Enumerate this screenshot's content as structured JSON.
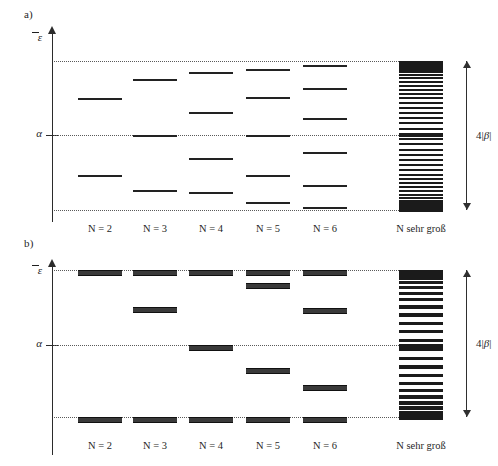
{
  "figure": {
    "caption_a": "a)",
    "caption_b": "b)",
    "axis_label_energy": "ε",
    "axis_label_alpha": "α",
    "measure_label_prefix": "4|",
    "measure_label_symbol": "β",
    "measure_label_suffix": "|",
    "column_labels": [
      "N = 2",
      "N = 3",
      "N = 4",
      "N = 5",
      "N = 6",
      "N sehr groß"
    ]
  },
  "chart_data": {
    "type": "scatter",
    "xlabel": "",
    "ylabel": "ε",
    "grid": false,
    "legend": null,
    "axis_annotations": [
      {
        "label": "ε",
        "kind": "axis-arrow-top"
      },
      {
        "label": "α",
        "kind": "tick",
        "value": 0.0
      },
      {
        "label": "4|β|",
        "kind": "span",
        "from": -2.0,
        "to": 2.0
      }
    ],
    "reference_lines": [
      {
        "name": "upper-limit",
        "value": 2.0,
        "style": "dotted"
      },
      {
        "name": "alpha",
        "value": 0.0,
        "style": "dotted"
      },
      {
        "name": "lower-limit",
        "value": -2.0,
        "style": "dotted"
      }
    ],
    "ylim": [
      -2.35,
      2.35
    ],
    "note": "Energien in Einheiten von |β| relativ zu α; Bandbreite 4|β|",
    "panels": [
      {
        "id": "a",
        "label": "a)",
        "description": "lineare Polyene, nicht entartete Niveaus",
        "categories": [
          "N = 2",
          "N = 3",
          "N = 4",
          "N = 5",
          "N = 6",
          "N sehr groß"
        ],
        "series": [
          {
            "name": "N = 2",
            "values": [
              1.0,
              -1.0
            ],
            "degeneracies": [
              1,
              1
            ]
          },
          {
            "name": "N = 3",
            "values": [
              1.414,
              0.0,
              -1.414
            ],
            "degeneracies": [
              1,
              1,
              1
            ]
          },
          {
            "name": "N = 4",
            "values": [
              1.618,
              0.618,
              -0.618,
              -1.618
            ],
            "degeneracies": [
              1,
              1,
              1,
              1
            ]
          },
          {
            "name": "N = 5",
            "values": [
              1.732,
              1.0,
              0.0,
              -1.0,
              -1.732
            ],
            "degeneracies": [
              1,
              1,
              1,
              1,
              1
            ]
          },
          {
            "name": "N = 6",
            "values": [
              1.802,
              1.247,
              0.445,
              -0.445,
              -1.247,
              -1.802
            ],
            "degeneracies": [
              1,
              1,
              1,
              1,
              1,
              1
            ]
          },
          {
            "name": "N sehr groß",
            "values": [
              2.0,
              -2.0
            ],
            "degeneracies": [
              1,
              1
            ],
            "continuum": true,
            "band_levels": 44
          }
        ]
      },
      {
        "id": "b",
        "label": "b)",
        "description": "cyclische Annulene, paarweise entartete Niveaus",
        "categories": [
          "N = 2",
          "N = 3",
          "N = 4",
          "N = 5",
          "N = 6",
          "N sehr groß"
        ],
        "series": [
          {
            "name": "N = 2",
            "values": [
              2.0,
              -2.0
            ],
            "degeneracies": [
              1,
              1
            ]
          },
          {
            "name": "N = 3",
            "values": [
              2.0,
              1.0,
              -2.0
            ],
            "degeneracies": [
              1,
              2,
              1
            ]
          },
          {
            "name": "N = 4",
            "values": [
              2.0,
              0.0,
              -2.0
            ],
            "degeneracies": [
              1,
              2,
              1
            ]
          },
          {
            "name": "N = 5",
            "values": [
              2.0,
              1.618,
              -0.618,
              -2.0
            ],
            "degeneracies": [
              1,
              2,
              2,
              1
            ]
          },
          {
            "name": "N = 6",
            "values": [
              2.0,
              1.0,
              -1.0,
              -2.0
            ],
            "degeneracies": [
              1,
              2,
              2,
              1
            ]
          },
          {
            "name": "N sehr groß",
            "values": [
              2.0,
              -2.0
            ],
            "degeneracies": [
              1,
              1
            ],
            "continuum": true,
            "band_levels": 26
          }
        ]
      }
    ]
  },
  "geometry": {
    "panel_a": {
      "axis_top": 34,
      "axis_bottom": 222,
      "y_upper": 61,
      "y_alpha": 135,
      "y_lower": 210,
      "columns": [
        {
          "label": "N = 2",
          "x": 78,
          "w": 44,
          "cx": 100,
          "levels": [
            {
              "y": 98,
              "t": "thin"
            },
            {
              "y": 175,
              "t": "thin"
            }
          ]
        },
        {
          "label": "N = 3",
          "x": 133,
          "w": 44,
          "cx": 155,
          "levels": [
            {
              "y": 79,
              "t": "thin"
            },
            {
              "y": 135,
              "t": "thin"
            },
            {
              "y": 190,
              "t": "thin"
            }
          ]
        },
        {
          "label": "N = 4",
          "x": 189,
          "w": 44,
          "cx": 211,
          "levels": [
            {
              "y": 72,
              "t": "thin"
            },
            {
              "y": 112,
              "t": "thin"
            },
            {
              "y": 158,
              "t": "thin"
            },
            {
              "y": 192,
              "t": "thin"
            }
          ]
        },
        {
          "label": "N = 5",
          "x": 246,
          "w": 44,
          "cx": 268,
          "levels": [
            {
              "y": 69,
              "t": "thin"
            },
            {
              "y": 97,
              "t": "thin"
            },
            {
              "y": 135,
              "t": "thin"
            },
            {
              "y": 175,
              "t": "thin"
            },
            {
              "y": 202,
              "t": "thin"
            }
          ]
        },
        {
          "label": "N = 6",
          "x": 303,
          "w": 44,
          "cx": 325,
          "levels": [
            {
              "y": 65,
              "t": "thin"
            },
            {
              "y": 88,
              "t": "thin"
            },
            {
              "y": 118,
              "t": "thin"
            },
            {
              "y": 152,
              "t": "thin"
            },
            {
              "y": 185,
              "t": "thin"
            },
            {
              "y": 207,
              "t": "thin"
            }
          ]
        }
      ],
      "band": {
        "x": 399,
        "w": 44,
        "cx": 421,
        "top": 61,
        "bottom": 210
      }
    },
    "panel_b": {
      "axis_top": 267,
      "axis_bottom": 455,
      "y_upper": 270,
      "y_alpha": 345,
      "y_lower": 417,
      "columns": [
        {
          "label": "N = 2",
          "x": 78,
          "w": 44,
          "cx": 100,
          "levels": [
            {
              "y": 270,
              "t": "thick"
            },
            {
              "y": 417,
              "t": "thick"
            }
          ]
        },
        {
          "label": "N = 3",
          "x": 133,
          "w": 44,
          "cx": 155,
          "levels": [
            {
              "y": 270,
              "t": "thick"
            },
            {
              "y": 307,
              "t": "thick"
            },
            {
              "y": 417,
              "t": "thick"
            }
          ]
        },
        {
          "label": "N = 4",
          "x": 189,
          "w": 44,
          "cx": 211,
          "levels": [
            {
              "y": 270,
              "t": "thick"
            },
            {
              "y": 345,
              "t": "thick"
            },
            {
              "y": 417,
              "t": "thick"
            }
          ]
        },
        {
          "label": "N = 5",
          "x": 246,
          "w": 44,
          "cx": 268,
          "levels": [
            {
              "y": 270,
              "t": "thick"
            },
            {
              "y": 283,
              "t": "thick"
            },
            {
              "y": 368,
              "t": "thick"
            },
            {
              "y": 417,
              "t": "thick"
            }
          ]
        },
        {
          "label": "N = 6",
          "x": 303,
          "w": 44,
          "cx": 325,
          "levels": [
            {
              "y": 270,
              "t": "thick"
            },
            {
              "y": 308,
              "t": "thick"
            },
            {
              "y": 385,
              "t": "thick"
            },
            {
              "y": 417,
              "t": "thick"
            }
          ]
        }
      ],
      "band": {
        "x": 399,
        "w": 44,
        "cx": 421,
        "top": 270,
        "bottom": 417
      }
    },
    "measure_a": {
      "x": 466,
      "top": 61,
      "bottom": 210,
      "label_y": 128
    },
    "measure_b": {
      "x": 466,
      "top": 270,
      "bottom": 417,
      "label_y": 336
    },
    "col_label_y_a": 223,
    "col_label_y_b": 440
  }
}
